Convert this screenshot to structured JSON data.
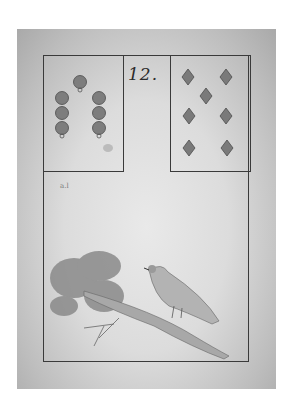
{
  "card": {
    "number": "12.",
    "left_suit": {
      "name": "bells",
      "count": 7,
      "icon": "bell-icon"
    },
    "right_suit": {
      "name": "diamonds",
      "count": 7,
      "icon": "diamond-icon"
    },
    "illustration": {
      "subject": "bird on branch",
      "icon": "bird-icon"
    },
    "corner_mark": "a.l",
    "colors": {
      "paper": "#dcdcdc",
      "ink": "#3a3a3a",
      "suit": "#7a7a7a"
    }
  }
}
